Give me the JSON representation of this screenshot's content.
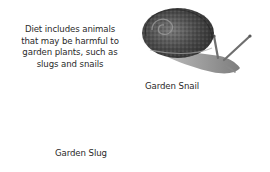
{
  "caption": "Diet includes animals that may be harmful to garden plants, such as slugs and snails",
  "illustrations": [
    {
      "name": "garden-snail",
      "label": "Garden Snail"
    },
    {
      "name": "garden-slug",
      "label": "Garden Slug"
    }
  ],
  "colors": {
    "background": "#ffffff",
    "text": "#2a2a2a",
    "shell_dark": "#3c3c3c",
    "shell_mid": "#6a6a6a",
    "body_light": "#b5b5b5"
  }
}
